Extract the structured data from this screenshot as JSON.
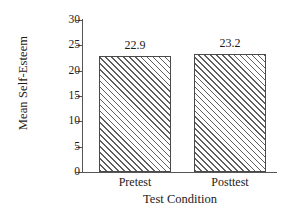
{
  "chart_data": {
    "type": "bar",
    "title": "",
    "categories": [
      "Pretest",
      "Posttest"
    ],
    "values": [
      22.9,
      23.2
    ],
    "value_labels": [
      "22.9",
      "23.2"
    ],
    "xlabel": "Test Condition",
    "ylabel": "Mean Self-Esteem",
    "ylim": [
      0,
      30
    ],
    "yticks": [
      0,
      5,
      10,
      15,
      20,
      25,
      30
    ],
    "ytick_labels": [
      "0",
      "5",
      "10",
      "15",
      "20",
      "25",
      "30"
    ],
    "grid": false,
    "legend": false,
    "bar_fill": "hatched-diagonal",
    "bar_edge_color": "#4a4a4a",
    "hatch_color": "#5e5e5e",
    "background_color": "#ffffff"
  },
  "axes": {
    "y_title": "Mean Self-Esteem",
    "x_title": "Test Condition"
  },
  "series_points": [
    {
      "category": "Pretest",
      "value": 22.9,
      "label": "22.9"
    },
    {
      "category": "Posttest",
      "value": 23.2,
      "label": "23.2"
    }
  ]
}
